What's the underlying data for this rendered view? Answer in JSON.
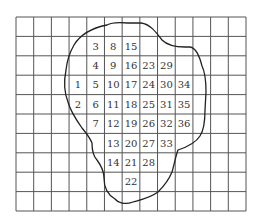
{
  "diagram": {
    "type": "grid-with-blob-outline",
    "grid": {
      "columns": 13,
      "rows": 10,
      "left": 16,
      "top": 17,
      "right": 246,
      "bottom": 211,
      "line_color": "#555555"
    },
    "outline_color": "#222222",
    "cells": [
      {
        "label": "3",
        "row": 1,
        "col": 4
      },
      {
        "label": "8",
        "row": 1,
        "col": 5
      },
      {
        "label": "15",
        "row": 1,
        "col": 6
      },
      {
        "label": "4",
        "row": 2,
        "col": 4
      },
      {
        "label": "9",
        "row": 2,
        "col": 5
      },
      {
        "label": "16",
        "row": 2,
        "col": 6
      },
      {
        "label": "23",
        "row": 2,
        "col": 7
      },
      {
        "label": "29",
        "row": 2,
        "col": 8
      },
      {
        "label": "1",
        "row": 3,
        "col": 3
      },
      {
        "label": "5",
        "row": 3,
        "col": 4
      },
      {
        "label": "10",
        "row": 3,
        "col": 5
      },
      {
        "label": "17",
        "row": 3,
        "col": 6
      },
      {
        "label": "24",
        "row": 3,
        "col": 7
      },
      {
        "label": "30",
        "row": 3,
        "col": 8
      },
      {
        "label": "34",
        "row": 3,
        "col": 9
      },
      {
        "label": "2",
        "row": 4,
        "col": 3
      },
      {
        "label": "6",
        "row": 4,
        "col": 4
      },
      {
        "label": "11",
        "row": 4,
        "col": 5
      },
      {
        "label": "18",
        "row": 4,
        "col": 6
      },
      {
        "label": "25",
        "row": 4,
        "col": 7
      },
      {
        "label": "31",
        "row": 4,
        "col": 8
      },
      {
        "label": "35",
        "row": 4,
        "col": 9
      },
      {
        "label": "7",
        "row": 5,
        "col": 4
      },
      {
        "label": "12",
        "row": 5,
        "col": 5
      },
      {
        "label": "19",
        "row": 5,
        "col": 6
      },
      {
        "label": "26",
        "row": 5,
        "col": 7
      },
      {
        "label": "32",
        "row": 5,
        "col": 8
      },
      {
        "label": "36",
        "row": 5,
        "col": 9
      },
      {
        "label": "13",
        "row": 6,
        "col": 5
      },
      {
        "label": "20",
        "row": 6,
        "col": 6
      },
      {
        "label": "27",
        "row": 6,
        "col": 7
      },
      {
        "label": "33",
        "row": 6,
        "col": 8
      },
      {
        "label": "14",
        "row": 7,
        "col": 5
      },
      {
        "label": "21",
        "row": 7,
        "col": 6
      },
      {
        "label": "28",
        "row": 7,
        "col": 7
      },
      {
        "label": "22",
        "row": 8,
        "col": 6
      }
    ]
  }
}
